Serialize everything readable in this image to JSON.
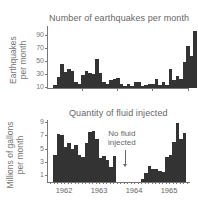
{
  "chart_data": [
    {
      "type": "bar",
      "title": "Number of earthquakes per month",
      "xlabel": "",
      "ylabel": "Earthquakes per month",
      "yticks": [
        10,
        30,
        50,
        70,
        90
      ],
      "ylim": [
        10,
        100
      ],
      "x": [
        "1962-01",
        "1962-02",
        "1962-03",
        "1962-04",
        "1962-05",
        "1962-06",
        "1962-07",
        "1962-08",
        "1962-09",
        "1962-10",
        "1962-11",
        "1962-12",
        "1963-01",
        "1963-02",
        "1963-03",
        "1963-04",
        "1963-05",
        "1963-06",
        "1963-07",
        "1963-08",
        "1963-09",
        "1963-10",
        "1963-11",
        "1963-12",
        "1964-01",
        "1964-02",
        "1964-03",
        "1964-04",
        "1964-05",
        "1964-06",
        "1964-07",
        "1964-08",
        "1964-09",
        "1964-10",
        "1964-11",
        "1964-12",
        "1965-01",
        "1965-02",
        "1965-03",
        "1965-04"
      ],
      "values": [
        13,
        25,
        45,
        33,
        37,
        35,
        18,
        15,
        29,
        34,
        32,
        30,
        52,
        32,
        18,
        15,
        20,
        22,
        23,
        14,
        12,
        15,
        12,
        18,
        18,
        12,
        13,
        14,
        15,
        22,
        13,
        17,
        13,
        38,
        20,
        27,
        22,
        48,
        72,
        58
      ],
      "extra_values_note": "final bars",
      "values_tail": [
        96,
        15
      ]
    },
    {
      "type": "bar",
      "title": "Quantity of fluid injected",
      "xlabel": "",
      "ylabel": "Millions of gallons per month",
      "yticks": [
        1,
        3,
        5,
        7,
        9
      ],
      "ylim": [
        0,
        9
      ],
      "xticklabels": [
        "1962",
        "1963",
        "1964",
        "1965"
      ],
      "annotation": "No fluid injected",
      "x": [
        "1962-03",
        "1962-04",
        "1962-05",
        "1962-06",
        "1962-07",
        "1962-08",
        "1962-09",
        "1962-10",
        "1962-11",
        "1962-12",
        "1963-01",
        "1963-02",
        "1963-03",
        "1963-04",
        "1963-05",
        "1963-06",
        "1963-07",
        "1963-08",
        "1963-09",
        "1963-10",
        "1963-11",
        "1963-12",
        "1964-01",
        "1964-02",
        "1964-03",
        "1964-04",
        "1964-05",
        "1964-06",
        "1964-07",
        "1964-08",
        "1964-09",
        "1964-10",
        "1964-11",
        "1964-12",
        "1965-01",
        "1965-02",
        "1965-03",
        "1965-04",
        "1965-05"
      ],
      "values": [
        4.0,
        7.2,
        7.0,
        5.2,
        5.8,
        5.0,
        5.5,
        4.0,
        3.7,
        5.9,
        7.5,
        7.7,
        6.5,
        3.6,
        3.9,
        3.3,
        2.3,
        3.9,
        0,
        0,
        0,
        0,
        0,
        0,
        0,
        0.5,
        1.3,
        2.4,
        2.0,
        1.9,
        1.7,
        1.5,
        3.7,
        4.0,
        6.0,
        8.8,
        6.4,
        7.4,
        0
      ]
    }
  ],
  "labels": {
    "top_title": "Number of earthquakes per month",
    "top_ylabel_line1": "Earthquakes",
    "top_ylabel_line2": "per month",
    "bottom_title": "Quantity of fluid injected",
    "bottom_ylabel_line1": "Millions of gallons",
    "bottom_ylabel_line2": "per month",
    "annotation_line1": "No fluid",
    "annotation_line2": "injected",
    "top_yticks": [
      "90",
      "70",
      "50",
      "30",
      "10"
    ],
    "bottom_yticks": [
      "9",
      "7",
      "5",
      "3",
      "1"
    ],
    "xticks": [
      "1962",
      "1963",
      "1964",
      "1965"
    ]
  }
}
